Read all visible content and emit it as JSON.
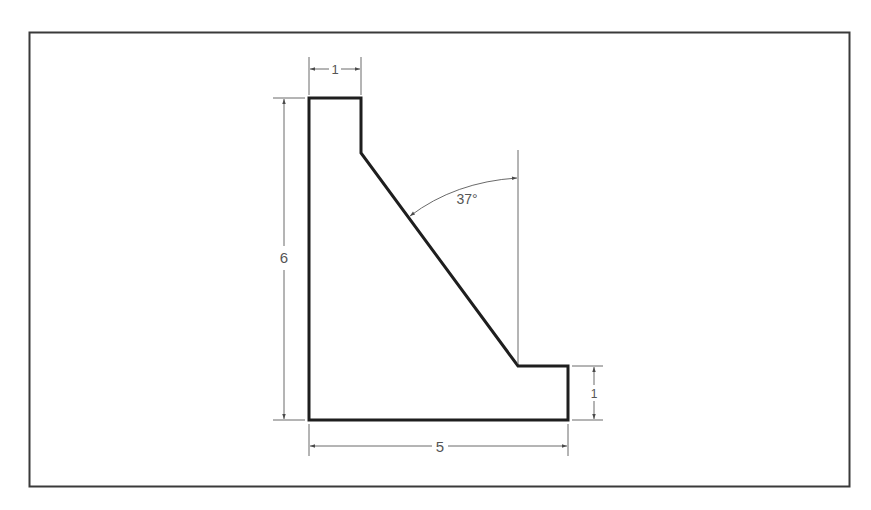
{
  "drawing": {
    "type": "orthographic-dimensioned-part",
    "colors": {
      "frame": "#3a3a3a",
      "outline": "#1e1e1e",
      "dimension": "#6a6a6a",
      "text": "#555555"
    },
    "dimensions": {
      "top_width": "1",
      "overall_height": "6",
      "overall_width": "5",
      "right_height": "1",
      "angle": "37°"
    }
  }
}
